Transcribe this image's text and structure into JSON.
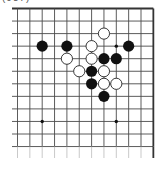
{
  "diagram": {
    "label": "(987)",
    "board": {
      "columns": 12,
      "rows": 12,
      "origin_x": 17.5,
      "origin_y": 8.5,
      "spacing_x": 12.35,
      "spacing_y": 12.55,
      "left_extension_x": 12,
      "bottom_extension_y": 158,
      "edges": [
        "top",
        "right"
      ],
      "line_color": "#4a4a4a",
      "edge_color": "#333333"
    },
    "hoshi": [
      {
        "col": 8,
        "row": 3
      },
      {
        "col": 2,
        "row": 9
      },
      {
        "col": 8,
        "row": 9
      }
    ],
    "stones": {
      "black": [
        {
          "col": 2,
          "row": 3
        },
        {
          "col": 4,
          "row": 3
        },
        {
          "col": 9,
          "row": 3
        },
        {
          "col": 7,
          "row": 4
        },
        {
          "col": 8,
          "row": 4
        },
        {
          "col": 6,
          "row": 5
        },
        {
          "col": 6,
          "row": 6
        },
        {
          "col": 7,
          "row": 7
        }
      ],
      "white": [
        {
          "col": 7,
          "row": 2
        },
        {
          "col": 6,
          "row": 3
        },
        {
          "col": 4,
          "row": 4
        },
        {
          "col": 6,
          "row": 4
        },
        {
          "col": 5,
          "row": 5
        },
        {
          "col": 7,
          "row": 5
        },
        {
          "col": 7,
          "row": 6
        },
        {
          "col": 8,
          "row": 6
        }
      ]
    },
    "stone_radius": 5.6,
    "colors": {
      "black_stone": "#111111",
      "white_stone": "#ffffff",
      "stone_outline": "#222222"
    }
  }
}
